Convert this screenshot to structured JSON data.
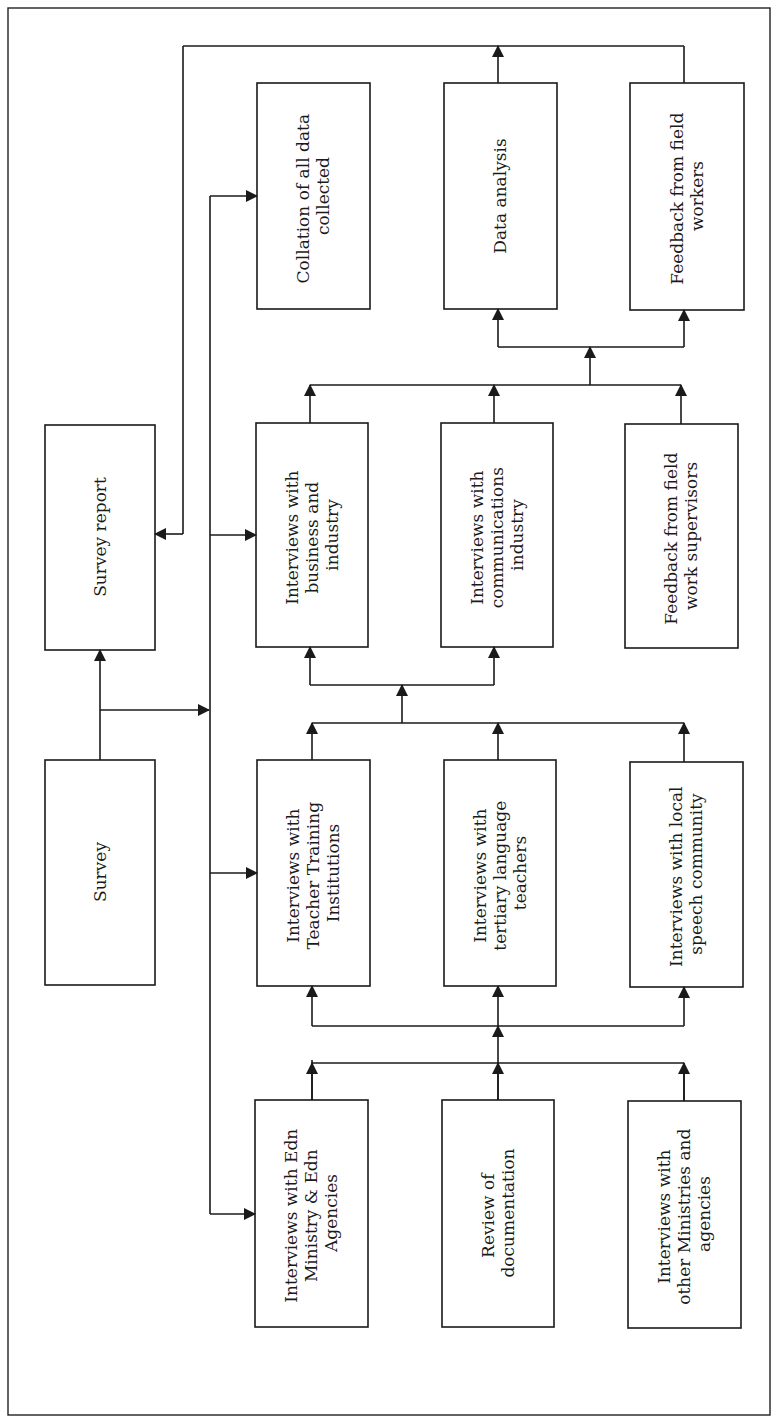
{
  "diagram": {
    "type": "flowchart",
    "orientation": "rotated-90-ccw",
    "boxes": {
      "survey": {
        "lines": [
          "Survey"
        ]
      },
      "survey_report": {
        "lines": [
          "Survey report"
        ]
      },
      "collation": {
        "lines": [
          "Collation of all data",
          "collected"
        ]
      },
      "data_analysis": {
        "lines": [
          "Data analysis"
        ]
      },
      "feedback_workers": {
        "lines": [
          "Feedback from field",
          "workers"
        ]
      },
      "business": {
        "lines": [
          "Interviews with",
          "business and",
          "industry"
        ]
      },
      "communications": {
        "lines": [
          "Interviews with",
          "communications",
          "industry"
        ]
      },
      "feedback_supervisors": {
        "lines": [
          "Feedback from field",
          "work supervisors"
        ]
      },
      "teacher_training": {
        "lines": [
          "Interviews with",
          "Teacher Training",
          "Institutions"
        ]
      },
      "tertiary": {
        "lines": [
          "Interviews with",
          "tertiary language",
          "teachers"
        ]
      },
      "local_speech": {
        "lines": [
          "Interviews with local",
          "speech community"
        ]
      },
      "edn_ministry": {
        "lines": [
          "Interviews with Edn",
          "Ministry & Edn",
          "Agencies"
        ]
      },
      "documentation": {
        "lines": [
          "Review of",
          "documentation"
        ]
      },
      "other_ministries": {
        "lines": [
          "Interviews with",
          "other Ministries and",
          "agencies"
        ]
      }
    },
    "edges": [
      [
        "survey",
        "survey_report"
      ],
      [
        "survey",
        "distribution_bus"
      ],
      [
        "distribution_bus",
        "collation"
      ],
      [
        "distribution_bus",
        "business"
      ],
      [
        "distribution_bus",
        "teacher_training"
      ],
      [
        "distribution_bus",
        "edn_ministry"
      ],
      [
        "edn_ministry",
        "teacher_training"
      ],
      [
        "documentation",
        "tertiary"
      ],
      [
        "other_ministries",
        "local_speech"
      ],
      [
        "teacher_training",
        "business"
      ],
      [
        "tertiary",
        "communications"
      ],
      [
        "local_speech",
        "communications"
      ],
      [
        "business",
        "data_analysis"
      ],
      [
        "communications",
        "data_analysis"
      ],
      [
        "feedback_supervisors",
        "feedback_workers"
      ],
      [
        "data_analysis",
        "survey_report"
      ],
      [
        "feedback_workers",
        "survey_report"
      ]
    ]
  }
}
